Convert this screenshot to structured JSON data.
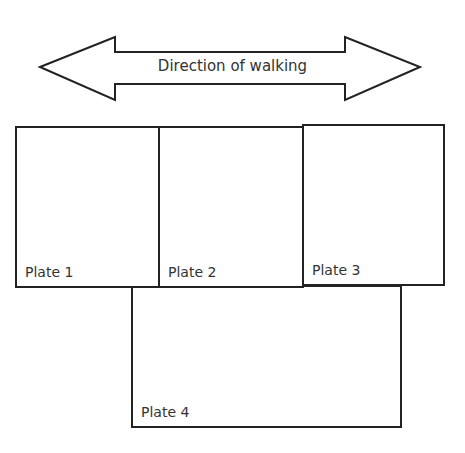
{
  "arrow": {
    "label": "Direction of walking",
    "type": "double-headed"
  },
  "plates": [
    {
      "label": "Plate 1"
    },
    {
      "label": "Plate 2"
    },
    {
      "label": "Plate 3"
    },
    {
      "label": "Plate 4"
    }
  ],
  "colors": {
    "stroke": "#222222",
    "text": "#333333",
    "background": "#ffffff"
  }
}
